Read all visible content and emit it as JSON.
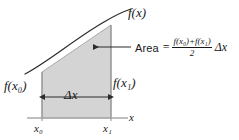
{
  "figure": {
    "background_color": "#ffffff",
    "ink_color": "#171717",
    "shaded_region_color": "#d4d4d4",
    "shaded_region_border_color": "#9a9a9a",
    "axis_color": "#a8a8a8",
    "curve_color": "#2b2b2b"
  },
  "labels": {
    "function_label": "f(x)",
    "function_name": "f",
    "left_height_label": "f(x₀)",
    "right_height_label": "f(x₁)",
    "width_label": "Δx",
    "axis_label": "x",
    "tick_x0": "x₀",
    "tick_x1": "x₁"
  },
  "area_annotation": {
    "word": "Area",
    "equals": "=",
    "numerator": "f(x₀)+f(x₁)",
    "denominator": "2",
    "trailing": "Δx",
    "full_text": "Area = [f(x₀)+f(x₁)]/2 Δx"
  },
  "geometry": {
    "axis_y": 118,
    "axis_x_start": 27,
    "axis_x_end": 128,
    "left_edge_x": 42,
    "right_edge_x": 111,
    "left_top_y": 72,
    "right_top_y": 25,
    "curve_start_x": 25,
    "curve_start_y": 74,
    "curve_end_x": 130,
    "curve_end_y": 14,
    "pointer_arrow_tip_x": 90,
    "pointer_arrow_tail_x": 131,
    "pointer_arrow_y": 47,
    "width_arrow_y": 97
  }
}
